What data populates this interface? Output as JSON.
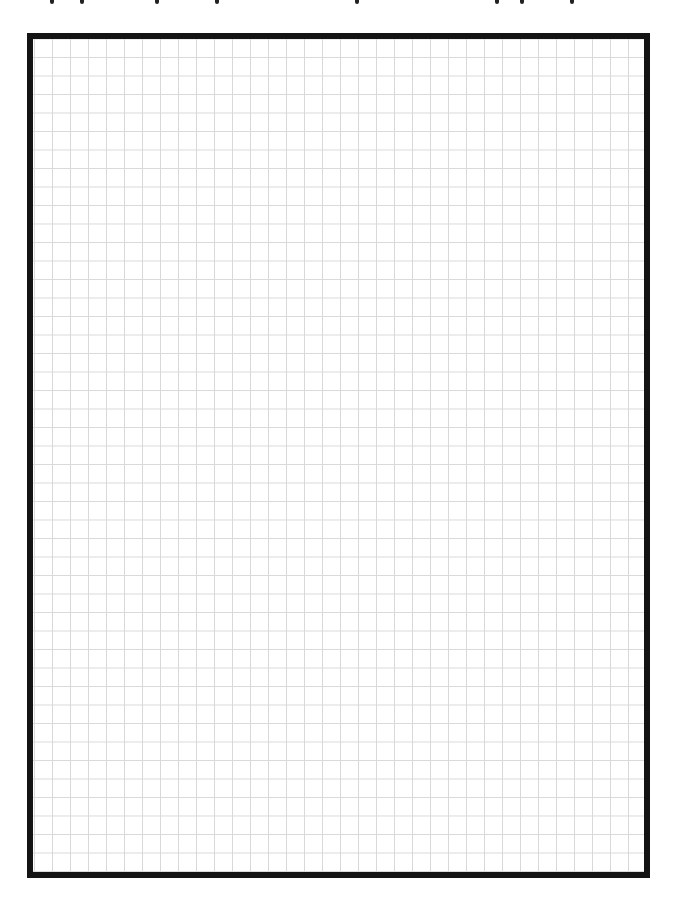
{
  "page": {
    "type": "graph-paper",
    "grid": {
      "cell_width_px": 18,
      "cell_height_px": 18.5,
      "line_color": "#d9d9d9",
      "columns": 34,
      "rows": 45
    },
    "frame": {
      "border_color": "#141414",
      "border_width_px": 6,
      "background": "#ffffff"
    },
    "clipped_header": {
      "description": "Text line cut off above viewport; only descenders visible",
      "descender_x_positions": [
        50,
        80,
        155,
        215,
        355,
        495,
        520,
        570
      ]
    }
  }
}
